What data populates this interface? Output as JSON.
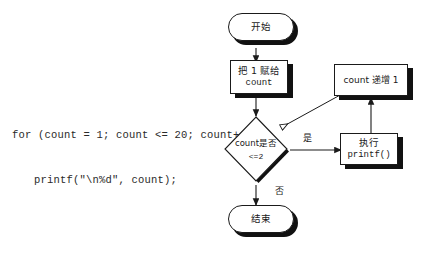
{
  "figure": {
    "type": "flowchart",
    "background_color": "#ffffff",
    "line_color": "#1a1a1a",
    "shadow_color": "#111111"
  },
  "code": {
    "line1": "for (count = 1; count <= 20; count++)",
    "line2": "printf(\"\\n%d\", count);"
  },
  "nodes": {
    "start": {
      "label": "开始",
      "shape": "terminator"
    },
    "assign": {
      "line1": "把 1 赋给",
      "line2": "count",
      "shape": "process"
    },
    "decision": {
      "line1": "count是否",
      "line2": "<=2",
      "shape": "decision"
    },
    "increment": {
      "label": "count 递增 1",
      "shape": "process"
    },
    "printf": {
      "line1": "执行",
      "line2": "printf()",
      "shape": "process"
    },
    "end": {
      "label": "结束",
      "shape": "terminator"
    }
  },
  "edges": {
    "yes_label": "是",
    "no_label": "否"
  }
}
